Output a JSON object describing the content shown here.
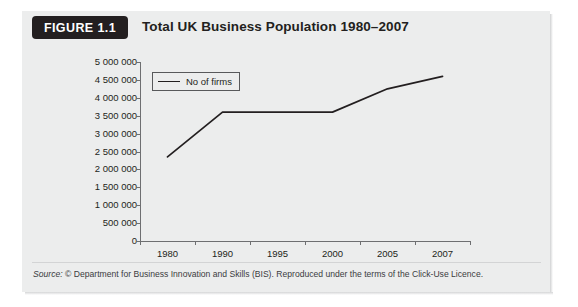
{
  "figure": {
    "badge_label": "FIGURE 1.1",
    "title": "Total UK Business Population 1980–2007",
    "source_label": "Source:",
    "source_text": "© Department for Business Innovation and Skills (BIS). Reproduced under the terms of the Click-Use Licence.",
    "panel_color": "#eceded",
    "badge_color": "#231f20",
    "line_color": "#231f20",
    "axis_color": "#6e6f71"
  },
  "chart_data": {
    "type": "line",
    "title": "Total UK Business Population 1980–2007",
    "xlabel": "",
    "ylabel": "",
    "categories": [
      "1980",
      "1990",
      "1995",
      "2000",
      "2005",
      "2007"
    ],
    "series": [
      {
        "name": "No of firms",
        "values": [
          2350000,
          3600000,
          3600000,
          3600000,
          4250000,
          4600000
        ]
      }
    ],
    "ylim": [
      0,
      5000000
    ],
    "ytick_values": [
      5000000,
      4500000,
      4000000,
      3500000,
      3000000,
      2500000,
      2000000,
      1500000,
      1000000,
      500000,
      0
    ],
    "ytick_labels": [
      "5 000 000",
      "4 500 000",
      "4 000 000",
      "3 500 000",
      "3 000 000",
      "2 500 000",
      "2 000 000",
      "1 500 000",
      "1 000 000",
      "500 000",
      "0"
    ],
    "grid": false,
    "legend": {
      "position": "top-left",
      "entries": [
        "No of firms"
      ]
    }
  }
}
